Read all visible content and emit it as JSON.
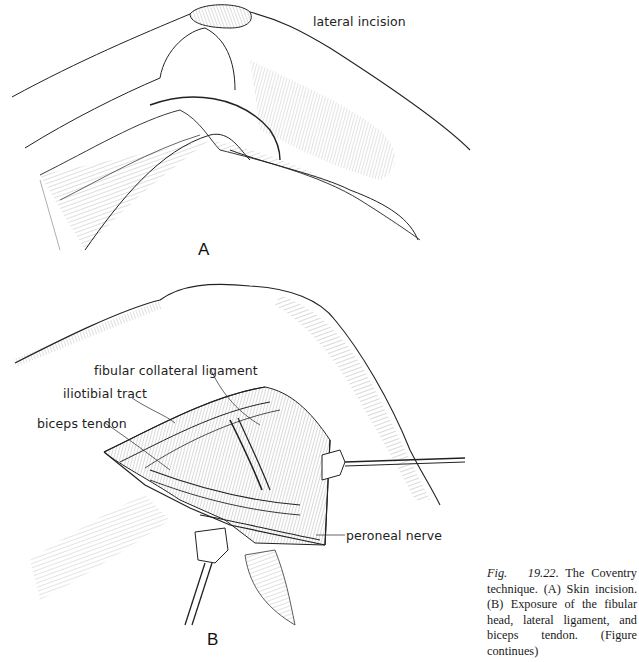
{
  "panel_a": {
    "letter": "A",
    "labels": {
      "lateral_incision": "lateral incision"
    }
  },
  "panel_b": {
    "letter": "B",
    "labels": {
      "fibular_collateral_ligament": "fibular collateral ligament",
      "iliotibial_tract": "iliotibial tract",
      "biceps_tendon": "biceps tendon",
      "peroneal_nerve": "peroneal nerve"
    }
  },
  "caption": {
    "fig_label": "Fig.",
    "fig_number": "19.22",
    "text": ". The Coventry technique. (A) Skin incision. (B) Exposure of the fibular head, lateral ligament, and biceps tendon. (Figure continues)"
  },
  "colors": {
    "ink": "#1a1a1a",
    "paper": "#ffffff"
  }
}
